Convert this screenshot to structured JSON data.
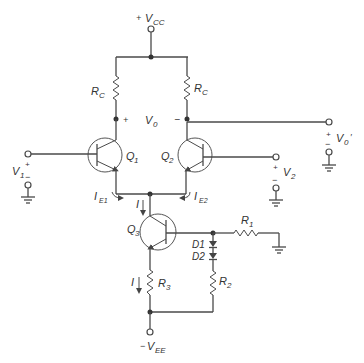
{
  "diagram": {
    "type": "circuit-schematic",
    "supplies": {
      "positive": {
        "label_sign": "+",
        "label": "V",
        "sub": "CC"
      },
      "negative": {
        "label_sign": "−",
        "label": "V",
        "sub": "EE"
      }
    },
    "resistors": [
      {
        "id": "RC_left",
        "label": "R",
        "sub": "C"
      },
      {
        "id": "RC_right",
        "label": "R",
        "sub": "C"
      },
      {
        "id": "R1",
        "label": "R",
        "sub": "1"
      },
      {
        "id": "R2",
        "label": "R",
        "sub": "2"
      },
      {
        "id": "R3",
        "label": "R",
        "sub": "3"
      }
    ],
    "transistors": [
      {
        "id": "Q1",
        "label": "Q",
        "sub": "1"
      },
      {
        "id": "Q2",
        "label": "Q",
        "sub": "2"
      },
      {
        "id": "Q3",
        "label": "Q",
        "sub": "3"
      }
    ],
    "diodes": [
      {
        "id": "D1",
        "label": "D1"
      },
      {
        "id": "D2",
        "label": "D2"
      }
    ],
    "output": {
      "label": "V",
      "sub": "0",
      "plus": "+",
      "minus": "−"
    },
    "output_prime": {
      "label": "V",
      "sub": "0",
      "prime": "′",
      "plus": "+",
      "minus": "−"
    },
    "inputs": [
      {
        "id": "V1",
        "label": "V",
        "sub": "1",
        "plus": "+",
        "minus": "−"
      },
      {
        "id": "V2",
        "label": "V",
        "sub": "2",
        "plus": "+",
        "minus": "−"
      }
    ],
    "currents": {
      "IE1": {
        "label": "I",
        "sub": "E1"
      },
      "IE2": {
        "label": "I",
        "sub": "E2"
      },
      "I_top": {
        "label": "I"
      },
      "I_bottom": {
        "label": "I"
      }
    }
  }
}
